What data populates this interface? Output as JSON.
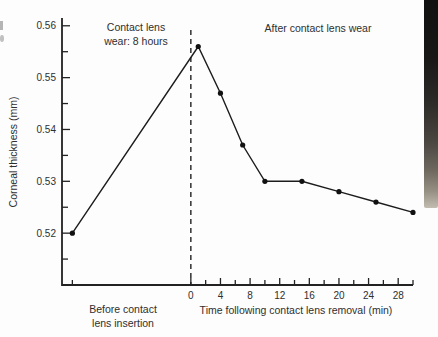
{
  "figure": {
    "colors": {
      "background": "#fdfdfd",
      "ink": "#222222",
      "text": "#2f2f2f",
      "book_edge_dark": "#101010",
      "book_edge_light": "#c2bcb1"
    }
  },
  "chart_data": {
    "type": "line",
    "title": "",
    "xlabel": "Time following contact lens removal (min)",
    "ylabel": "Corneal thickness (mm)",
    "annotations": {
      "wear_period": [
        "Contact lens",
        "wear: 8 hours"
      ],
      "after_wear": "After contact lens wear",
      "before_insertion": [
        "Before contact",
        "lens insertion"
      ]
    },
    "x_axis": {
      "unit": "min",
      "range": [
        -17.4,
        30
      ],
      "labeled_ticks": [
        0,
        4,
        8,
        12,
        16,
        20,
        24,
        28
      ],
      "minor_ticks": [
        -16,
        2,
        6,
        10,
        14,
        18,
        22,
        26,
        30
      ]
    },
    "y_axis": {
      "unit": "mm",
      "range": [
        0.51,
        0.5615
      ],
      "tick_values": [
        0.52,
        0.53,
        0.54,
        0.55,
        0.56
      ],
      "tick_labels": [
        "0.52",
        "0.53",
        "0.54",
        "0.55",
        "0.56"
      ],
      "minor_ticks": [
        0.515,
        0.525,
        0.535,
        0.545,
        0.555
      ]
    },
    "removal_marker_x": 0,
    "grid": false,
    "series": [
      {
        "name": "Corneal thickness",
        "x": [
          -16,
          1,
          4,
          7,
          10,
          15,
          20,
          25,
          30
        ],
        "y": [
          0.52,
          0.556,
          0.547,
          0.537,
          0.53,
          0.53,
          0.528,
          0.526,
          0.524
        ],
        "note": "first point plotted left of zero beneath the 'Before contact lens insertion' label"
      }
    ]
  }
}
